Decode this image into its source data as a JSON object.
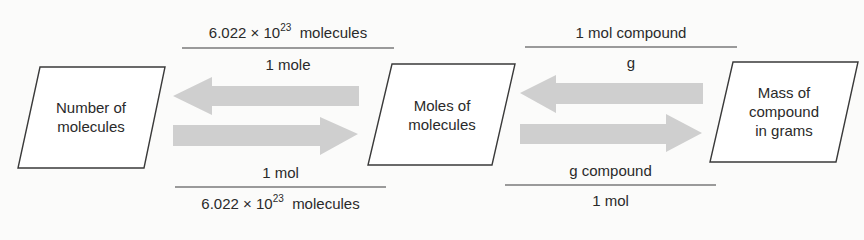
{
  "boxes": [
    {
      "id": "number",
      "line1": "Number of",
      "line2": "molecules"
    },
    {
      "id": "moles",
      "line1": "Moles of",
      "line2": "molecules"
    },
    {
      "id": "mass",
      "line1": "Mass of",
      "line2": "compound",
      "line3": "in grams"
    }
  ],
  "conversions": {
    "left_top": {
      "numerator_base": "6.022 × 10",
      "numerator_exp": "23",
      "numerator_unit": "molecules",
      "denominator": "1 mole"
    },
    "left_bottom": {
      "numerator": "1 mol",
      "denominator_base": "6.022 × 10",
      "denominator_exp": "23",
      "denominator_unit": "molecules"
    },
    "right_top": {
      "numerator": "1 mol compound",
      "denominator": "g"
    },
    "right_bottom": {
      "numerator": "g compound",
      "denominator": "1 mol"
    }
  },
  "colors": {
    "arrow": "#cfcfcf",
    "stroke": "#3a3a3a",
    "background": "#fbfbfa"
  }
}
